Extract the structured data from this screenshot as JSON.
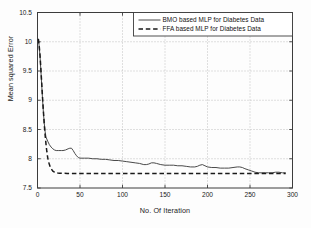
{
  "chart_data": {
    "type": "line",
    "title": "",
    "xlabel": "No. Of Iteration",
    "ylabel": "Mean squared Error",
    "xlim": [
      0,
      300
    ],
    "ylim": [
      7.5,
      10.5
    ],
    "xticks": [
      0,
      50,
      100,
      150,
      200,
      250,
      300
    ],
    "yticks": [
      7.5,
      8,
      8.5,
      9,
      9.5,
      10,
      10.5
    ],
    "xtick_labels": [
      "0",
      "50",
      "100",
      "150",
      "200",
      "250",
      "300"
    ],
    "ytick_labels": [
      "7.5",
      "8",
      "8.5",
      "9",
      "9.5",
      "10",
      "10.5"
    ],
    "grid": true,
    "grid_style": "dotted",
    "legend_position": "top-right",
    "series": [
      {
        "name": "BMO based MLP for Diabetes Data",
        "style": "solid",
        "color": "#4a4a4a",
        "x": [
          1,
          2,
          3,
          4,
          5,
          6,
          7,
          8,
          9,
          10,
          12,
          14,
          16,
          18,
          20,
          22,
          25,
          28,
          30,
          33,
          36,
          38,
          40,
          42,
          44,
          46,
          48,
          50,
          55,
          60,
          65,
          70,
          75,
          80,
          85,
          90,
          95,
          100,
          105,
          110,
          115,
          120,
          125,
          128,
          131,
          134,
          137,
          140,
          145,
          150,
          155,
          160,
          165,
          170,
          175,
          180,
          185,
          188,
          191,
          194,
          197,
          200,
          205,
          210,
          215,
          220,
          225,
          230,
          235,
          238,
          241,
          244,
          248,
          252,
          256,
          260,
          264,
          268,
          272,
          276,
          280,
          284,
          288,
          292
        ],
        "y": [
          10.05,
          9.92,
          9.74,
          9.5,
          9.25,
          9.0,
          8.78,
          8.6,
          8.46,
          8.37,
          8.3,
          8.24,
          8.2,
          8.17,
          8.15,
          8.14,
          8.14,
          8.14,
          8.14,
          8.15,
          8.17,
          8.18,
          8.18,
          8.14,
          8.09,
          8.05,
          8.02,
          8.01,
          8.01,
          8.01,
          8.0,
          8.0,
          7.99,
          7.99,
          7.98,
          7.97,
          7.97,
          7.96,
          7.95,
          7.94,
          7.93,
          7.92,
          7.9,
          7.9,
          7.91,
          7.93,
          7.93,
          7.92,
          7.9,
          7.89,
          7.89,
          7.89,
          7.88,
          7.88,
          7.87,
          7.86,
          7.86,
          7.87,
          7.89,
          7.9,
          7.88,
          7.86,
          7.85,
          7.85,
          7.84,
          7.84,
          7.84,
          7.85,
          7.86,
          7.86,
          7.85,
          7.83,
          7.81,
          7.79,
          7.77,
          7.76,
          7.76,
          7.76,
          7.76,
          7.76,
          7.77,
          7.77,
          7.76,
          7.76
        ]
      },
      {
        "name": "FFA based MLP for Diabetes Data",
        "style": "dashed",
        "color": "#1a1a1a",
        "x": [
          1,
          2,
          3,
          4,
          5,
          6,
          7,
          8,
          9,
          10,
          11,
          12,
          13,
          14,
          15,
          16,
          17,
          18,
          19,
          20,
          22,
          24,
          26,
          28,
          30,
          35,
          40,
          50,
          60,
          80,
          100,
          120,
          140,
          160,
          180,
          200,
          220,
          240,
          260,
          280,
          292
        ],
        "y": [
          10.05,
          9.93,
          9.76,
          9.53,
          9.28,
          9.03,
          8.8,
          8.58,
          8.4,
          8.25,
          8.12,
          8.02,
          7.95,
          7.9,
          7.86,
          7.83,
          7.81,
          7.79,
          7.78,
          7.77,
          7.76,
          7.755,
          7.753,
          7.752,
          7.751,
          7.75,
          7.75,
          7.75,
          7.75,
          7.75,
          7.75,
          7.75,
          7.75,
          7.75,
          7.75,
          7.75,
          7.75,
          7.75,
          7.75,
          7.75,
          7.75
        ]
      }
    ]
  },
  "legend": {
    "entries": [
      {
        "label": "BMO based MLP for Diabetes Data",
        "style": "solid"
      },
      {
        "label": "FFA based MLP for Diabetes Data",
        "style": "dashed"
      }
    ]
  },
  "axes": {
    "x_title": "No. Of Iteration",
    "y_title": "Mean squared Error"
  }
}
